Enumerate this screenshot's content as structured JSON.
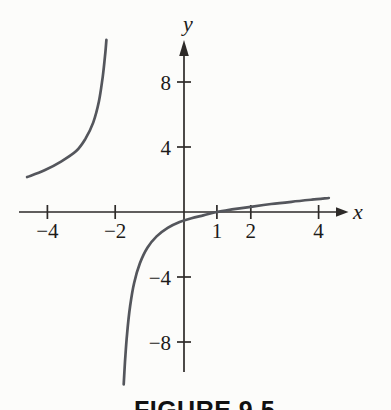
{
  "figure": {
    "caption": "FIGURE 9.5"
  },
  "colors": {
    "background": "#fcfcfa",
    "curve": "#54565c",
    "axis": "#2d2a28",
    "text": "#1d1b19",
    "caption": "#111111"
  },
  "chart_data": {
    "type": "line",
    "title": "FIGURE 9.5",
    "xlabel": "x",
    "ylabel": "y",
    "xlim": [
      -4.8,
      5.0
    ],
    "ylim": [
      -11,
      11
    ],
    "grid": false,
    "legend": false,
    "x_ticks": [
      {
        "v": -4,
        "label": "−4"
      },
      {
        "v": -2,
        "label": "−2"
      },
      {
        "v": 1,
        "label": "1"
      },
      {
        "v": 2,
        "label": "2"
      },
      {
        "v": 4,
        "label": "4"
      }
    ],
    "y_ticks": [
      {
        "v": 8,
        "label": "8"
      },
      {
        "v": 4,
        "label": "4"
      },
      {
        "v": -4,
        "label": "−4"
      },
      {
        "v": -8,
        "label": "−8"
      }
    ],
    "series": [
      {
        "name": "branch-left-of-vertical-asymptote",
        "points": [
          [
            -4.6,
            2.15
          ],
          [
            -4.1,
            2.55
          ],
          [
            -3.6,
            3.1
          ],
          [
            -3.15,
            3.75
          ],
          [
            -2.88,
            4.5
          ],
          [
            -2.65,
            5.5
          ],
          [
            -2.48,
            6.8
          ],
          [
            -2.37,
            8.3
          ],
          [
            -2.3,
            9.6
          ],
          [
            -2.26,
            10.6
          ]
        ]
      },
      {
        "name": "branch-right-of-vertical-asymptote",
        "points": [
          [
            -1.75,
            -10.6
          ],
          [
            -1.71,
            -9.2
          ],
          [
            -1.65,
            -7.5
          ],
          [
            -1.56,
            -5.8
          ],
          [
            -1.44,
            -4.35
          ],
          [
            -1.27,
            -3.15
          ],
          [
            -1.05,
            -2.2
          ],
          [
            -0.78,
            -1.5
          ],
          [
            -0.45,
            -0.98
          ],
          [
            -0.1,
            -0.62
          ],
          [
            0.25,
            -0.38
          ],
          [
            0.6,
            -0.21
          ],
          [
            1.0,
            0.0
          ],
          [
            1.5,
            0.17
          ],
          [
            2.0,
            0.32
          ],
          [
            2.6,
            0.49
          ],
          [
            3.2,
            0.63
          ],
          [
            3.8,
            0.76
          ],
          [
            4.3,
            0.86
          ]
        ]
      }
    ]
  }
}
